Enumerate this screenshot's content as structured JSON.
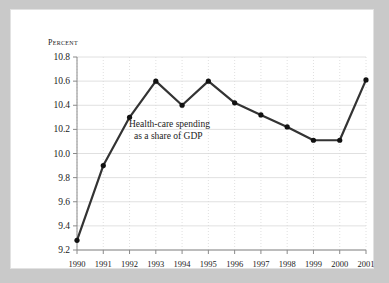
{
  "chart_data": {
    "type": "line",
    "title": "",
    "ylabel": "Percent",
    "xlabel": "",
    "categories": [
      "1990",
      "1991",
      "1992",
      "1993",
      "1994",
      "1995",
      "1996",
      "1997",
      "1998",
      "1999",
      "2000",
      "2001"
    ],
    "values": [
      9.28,
      9.9,
      10.3,
      10.6,
      10.4,
      10.6,
      10.42,
      10.32,
      10.22,
      10.11,
      10.11,
      10.61
    ],
    "series": [
      {
        "name": "Health-care spending as a share of GDP",
        "values": [
          9.28,
          9.9,
          10.3,
          10.6,
          10.4,
          10.6,
          10.42,
          10.32,
          10.22,
          10.11,
          10.11,
          10.61
        ]
      }
    ],
    "ylim": [
      9.2,
      10.8
    ],
    "ytick_labels": [
      "10.8",
      "10.6",
      "10.4",
      "10.2",
      "10.0",
      "9.8",
      "9.6",
      "9.4",
      "9.2"
    ],
    "ytick_values": [
      10.8,
      10.6,
      10.4,
      10.2,
      10.0,
      9.8,
      9.6,
      9.4,
      9.2
    ],
    "grid": true,
    "legend": "none",
    "annotations": [
      {
        "line1": "Health-care spending",
        "line2": "as a share of GDP"
      }
    ],
    "line_color": "#333333",
    "marker_color": "#111111",
    "grid_color": "#d8d8d8",
    "axis_color": "#8a8a8a",
    "background": "#ffffff",
    "page_background": "#c9c9c9"
  },
  "annotation": {
    "line1": "Health-care spending",
    "line2": "as a share of GDP"
  },
  "axis": {
    "y_title": "Percent"
  }
}
